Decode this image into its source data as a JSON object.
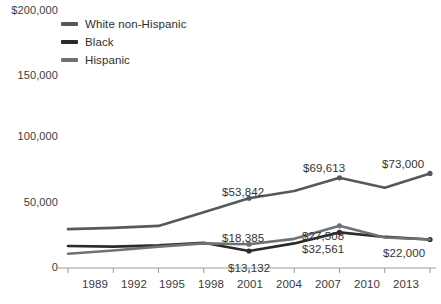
{
  "chart_data": {
    "type": "line",
    "title": "",
    "xlabel": "",
    "ylabel": "",
    "x": [
      "1989",
      "1992",
      "1995",
      "1998",
      "2001",
      "2004",
      "2007",
      "2010",
      "2013"
    ],
    "ylim": [
      0,
      200000
    ],
    "yticks": [
      "$200,000",
      "150,000",
      "100,000",
      "50,000",
      "0"
    ],
    "ytick_values": [
      200000,
      150000,
      100000,
      50000,
      0
    ],
    "grid": false,
    "legend_position": "top-left",
    "series": [
      {
        "name": "White non-Hispanic",
        "color": "#55595c",
        "values": [
          30000,
          31000,
          32500,
          43000,
          53842,
          59500,
          69613,
          62000,
          73000
        ],
        "labels": [
          {
            "x": "2001",
            "text": "$53,842"
          },
          {
            "x": "2007",
            "text": "$69,613"
          },
          {
            "x": "2013",
            "text": "$73,000"
          }
        ]
      },
      {
        "name": "Black",
        "color": "#2b2b2b",
        "values": [
          17000,
          16500,
          17500,
          19500,
          13132,
          19000,
          27508,
          24000,
          22000
        ],
        "labels": [
          {
            "x": "2001",
            "text": "$13,132"
          },
          {
            "x": "2007",
            "text": "$27,508"
          },
          {
            "x": "2013",
            "text": "$22,000"
          }
        ]
      },
      {
        "name": "Hispanic",
        "color": "#6e7275",
        "values": [
          11000,
          13500,
          16500,
          19000,
          18385,
          22500,
          32561,
          23500,
          22000
        ],
        "labels": [
          {
            "x": "2001",
            "text": "$18,385"
          },
          {
            "x": "2007",
            "text": "$32,561"
          }
        ]
      }
    ],
    "annotations": [
      {
        "text": "$53,842",
        "x": 222,
        "y": 186
      },
      {
        "text": "$69,613",
        "x": 303,
        "y": 162
      },
      {
        "text": "$73,000",
        "x": 382,
        "y": 158
      },
      {
        "text": "$18,385",
        "x": 222,
        "y": 232
      },
      {
        "text": "$13,132",
        "x": 228,
        "y": 262
      },
      {
        "text": "$27,508",
        "x": 302,
        "y": 230
      },
      {
        "text": "$32,561",
        "x": 302,
        "y": 243
      },
      {
        "text": "$22,000",
        "x": 383,
        "y": 247
      }
    ]
  },
  "axis": {
    "y_ticks": [
      {
        "label": "$200,000",
        "y": 4
      },
      {
        "label": "150,000",
        "y": 69
      },
      {
        "label": "100,000",
        "y": 130
      },
      {
        "label": "50,000",
        "y": 196
      },
      {
        "label": "0",
        "y": 261
      }
    ],
    "x_ticks": [
      {
        "label": "1989",
        "x": 95
      },
      {
        "label": "1992",
        "x": 133
      },
      {
        "label": "1995",
        "x": 172
      },
      {
        "label": "1998",
        "x": 211
      },
      {
        "label": "2001",
        "x": 250
      },
      {
        "label": "2004",
        "x": 289
      },
      {
        "label": "2007",
        "x": 328
      },
      {
        "label": "2010",
        "x": 367
      },
      {
        "label": "2013",
        "x": 406
      }
    ],
    "axis_color": "#9a9a9a"
  },
  "legend": {
    "items": [
      {
        "label": "White non-Hispanic",
        "color": "#55595c"
      },
      {
        "label": "Black",
        "color": "#2b2b2b"
      },
      {
        "label": "Hispanic",
        "color": "#6e7275"
      }
    ]
  }
}
